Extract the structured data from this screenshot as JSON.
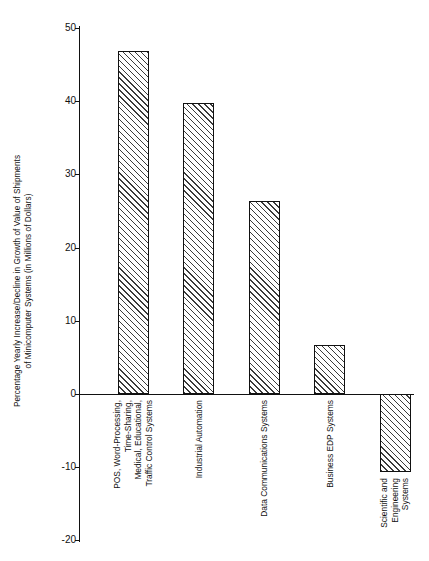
{
  "chart_data": {
    "type": "bar",
    "title": "",
    "subtitle": "",
    "xlabel": "",
    "ylabel": "Percentage Yearly Increase/Decline in Growth of Value of Shipments of Minicomputer Systems (in Millions of Dollars)",
    "ylabel_lines": [
      "Percentage Yearly Increase/Decline in Growth of Value of Shipments",
      "of Minicomputer Systems (in Millions of Dollars)"
    ],
    "ylim": [
      -20,
      50
    ],
    "yticks": [
      50,
      40,
      30,
      20,
      10,
      0,
      -10,
      -20
    ],
    "ytick_labels": [
      "50",
      "40",
      "30",
      "20",
      "10",
      "0",
      "-10",
      "-20"
    ],
    "grid": false,
    "legend": null,
    "zero_line": 0,
    "bar_style": "diagonal-hatch",
    "categories": [
      "POS, Word-Processing, Time-Sharing, Medical, Educational, Traffic Control Systems",
      "Industrial Automation",
      "Data Communications Systems",
      "Business EDP Systems",
      "Scientific and Engineering Systems"
    ],
    "category_lines": [
      [
        "POS, Word-Processing,",
        "Time-Sharing,",
        "Medical, Educational,",
        "Traffic Control Systems"
      ],
      [
        "Industrial Automation"
      ],
      [
        "Data Communications Systems"
      ],
      [
        "Business EDP Systems"
      ],
      [
        "Scientific and",
        "Engineering",
        "Systems"
      ]
    ],
    "values": [
      46.8,
      39.7,
      26.3,
      6.7,
      -10.7
    ],
    "colors": {
      "axis": "#111111",
      "bar_outline": "#111111",
      "bar_fill": "#ffffff",
      "hatch": "#3a3a3a",
      "background": "#ffffff",
      "text": "#111111"
    }
  }
}
